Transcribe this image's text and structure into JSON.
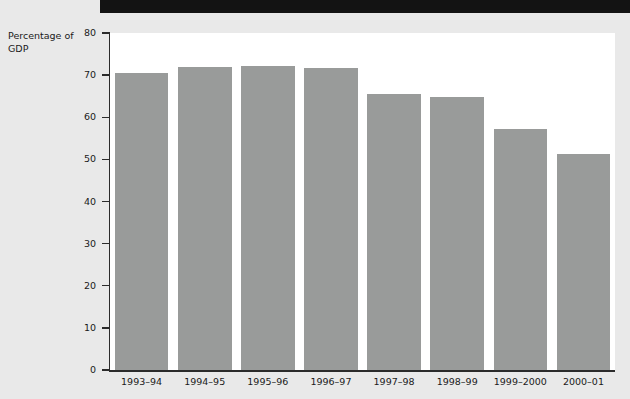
{
  "page": {
    "background_color": "#e9e9e9",
    "plot_background_color": "#ffffff",
    "band_color": "#131313",
    "bar_color": "#999b9a",
    "axis_color": "#2b2b2b"
  },
  "axis_title": "Percentage of\nGDP",
  "chart_data": {
    "type": "bar",
    "title": "",
    "xlabel": "",
    "ylabel": "Percentage of GDP",
    "categories": [
      "1993–94",
      "1994–95",
      "1995–96",
      "1996–97",
      "1997–98",
      "1998–99",
      "1999–2000",
      "2000–01"
    ],
    "values": [
      70.5,
      72.0,
      72.2,
      71.7,
      65.5,
      64.8,
      57.3,
      51.3
    ],
    "ylim": [
      0,
      80
    ],
    "yticks": [
      0,
      10,
      20,
      30,
      40,
      50,
      60,
      70,
      80
    ],
    "ytick_labels": [
      "0",
      "10",
      "20",
      "30",
      "40",
      "50",
      "60",
      "70",
      "80"
    ],
    "grid": false,
    "legend": null,
    "series": [
      {
        "name": "Percentage of GDP",
        "values": [
          70.5,
          72.0,
          72.2,
          71.7,
          65.5,
          64.8,
          57.3,
          51.3
        ]
      }
    ]
  }
}
